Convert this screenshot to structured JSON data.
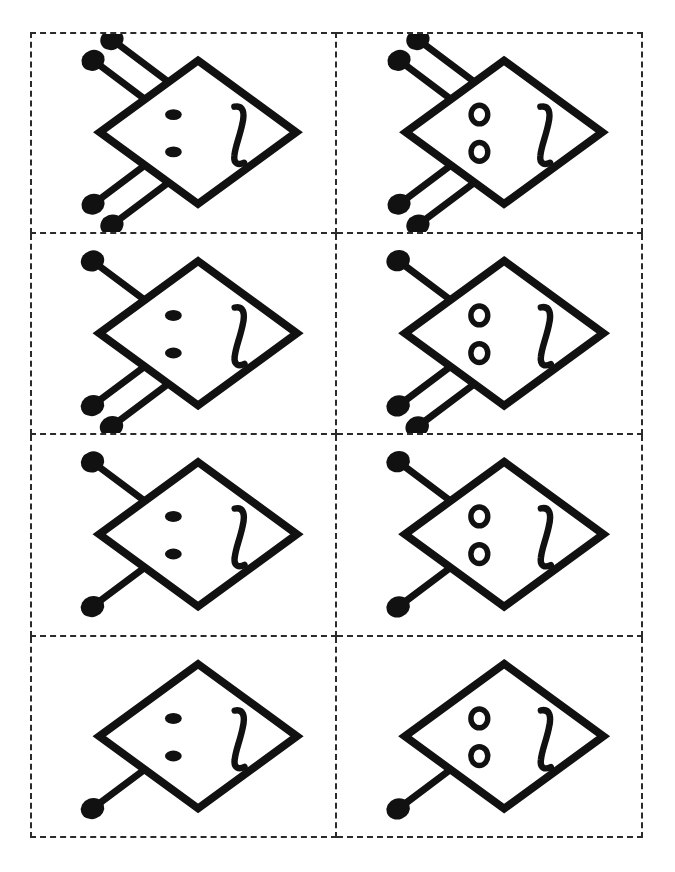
{
  "page": {
    "width": 675,
    "height": 872,
    "background_color": "#ffffff",
    "ink_color": "#111111",
    "border_style": "dashed",
    "border_color": "#2b2b2b",
    "faint_header_text": "",
    "grid": {
      "rows": 4,
      "columns": 2,
      "cell_count": 8
    }
  },
  "legend": {
    "shape_name": "diamond",
    "eye_type_filled": "filled-dot-eyes",
    "eye_type_hollow": "hollow-ring-eyes",
    "mouth_name": "squiggle-mouth",
    "antenna_name": "ball-tipped-antenna"
  },
  "cards": [
    {
      "id": "card-r1c1",
      "row": 1,
      "column": 1,
      "position_label": "row 1 left",
      "eyes": "filled",
      "eye_count": 2,
      "mouth": "squiggle",
      "antenna_count": 4,
      "antennae_top": 2,
      "antennae_bottom": 2
    },
    {
      "id": "card-r1c2",
      "row": 1,
      "column": 2,
      "position_label": "row 1 right",
      "eyes": "hollow",
      "eye_count": 2,
      "mouth": "squiggle",
      "antenna_count": 4,
      "antennae_top": 2,
      "antennae_bottom": 2
    },
    {
      "id": "card-r2c1",
      "row": 2,
      "column": 1,
      "position_label": "row 2 left",
      "eyes": "filled",
      "eye_count": 2,
      "mouth": "squiggle",
      "antenna_count": 3,
      "antennae_top": 1,
      "antennae_bottom": 2
    },
    {
      "id": "card-r2c2",
      "row": 2,
      "column": 2,
      "position_label": "row 2 right",
      "eyes": "hollow",
      "eye_count": 2,
      "mouth": "squiggle",
      "antenna_count": 3,
      "antennae_top": 1,
      "antennae_bottom": 2
    },
    {
      "id": "card-r3c1",
      "row": 3,
      "column": 1,
      "position_label": "row 3 left",
      "eyes": "filled",
      "eye_count": 2,
      "mouth": "squiggle",
      "antenna_count": 2,
      "antennae_top": 1,
      "antennae_bottom": 1
    },
    {
      "id": "card-r3c2",
      "row": 3,
      "column": 2,
      "position_label": "row 3 right",
      "eyes": "hollow",
      "eye_count": 2,
      "mouth": "squiggle",
      "antenna_count": 2,
      "antennae_top": 1,
      "antennae_bottom": 1
    },
    {
      "id": "card-r4c1",
      "row": 4,
      "column": 1,
      "position_label": "row 4 left",
      "eyes": "filled",
      "eye_count": 2,
      "mouth": "squiggle",
      "antenna_count": 1,
      "antennae_top": 0,
      "antennae_bottom": 1
    },
    {
      "id": "card-r4c2",
      "row": 4,
      "column": 2,
      "position_label": "row 4 right",
      "eyes": "hollow",
      "eye_count": 2,
      "mouth": "squiggle",
      "antenna_count": 1,
      "antennae_top": 0,
      "antennae_bottom": 1
    }
  ]
}
